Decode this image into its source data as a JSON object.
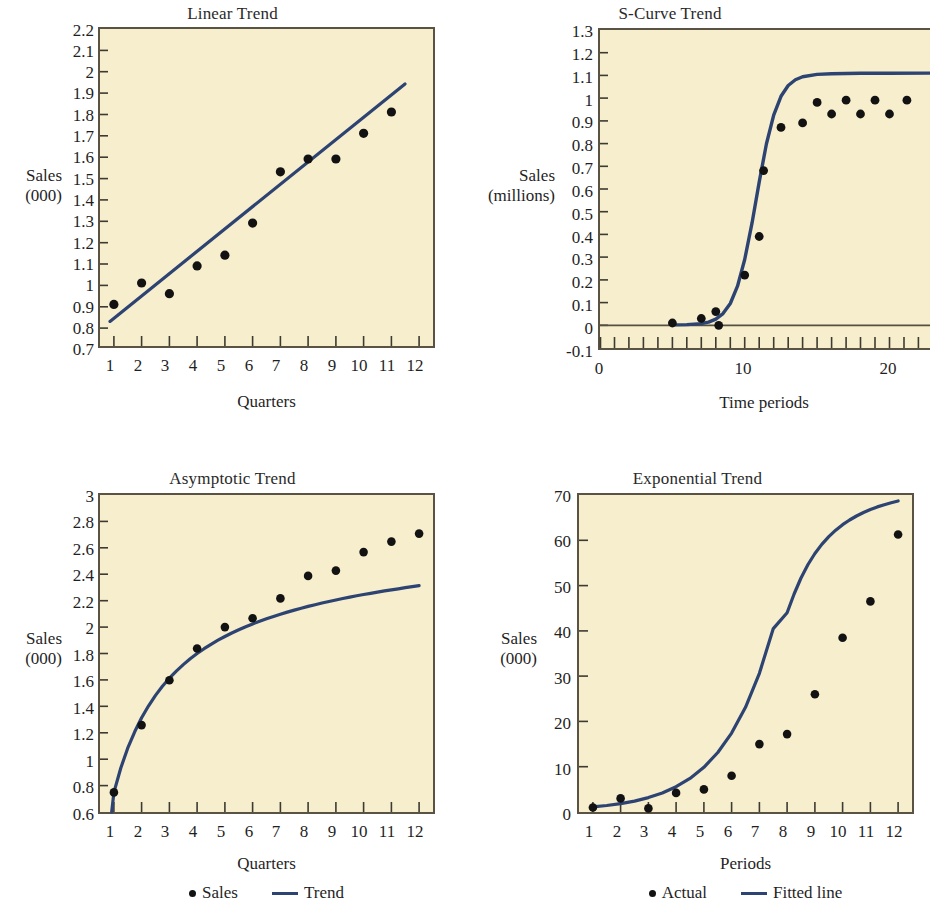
{
  "figure": {
    "background": "#ffffff",
    "panel_background": "#f7eecd",
    "panel_border_color": "#5a5344",
    "line_color": "#2d4372",
    "marker_color": "#121212"
  },
  "charts": [
    {
      "id": "linear-trend",
      "type": "scatter",
      "title": "Linear Trend",
      "xlabel": "Quarters",
      "ylabel": "Sales\n(000)",
      "ylabel_lines": [
        "Sales",
        "(000)"
      ],
      "xlim": [
        0.5,
        12.5
      ],
      "ylim": [
        0.7,
        2.2
      ],
      "xticks": [
        1,
        2,
        3,
        4,
        5,
        6,
        7,
        8,
        9,
        10,
        11,
        12
      ],
      "xtick_labels": [
        "1",
        "2",
        "3",
        "4",
        "5",
        "6",
        "7",
        "8",
        "9",
        "10",
        "11",
        "12"
      ],
      "yticks": [
        0.7,
        0.8,
        0.9,
        1.0,
        1.1,
        1.2,
        1.3,
        1.4,
        1.5,
        1.6,
        1.7,
        1.8,
        1.9,
        2.0,
        2.1,
        2.2
      ],
      "ytick_labels": [
        "0.7",
        "0.8",
        "0.9",
        "1",
        "1.1",
        "1.2",
        "1.3",
        "1.4",
        "1.5",
        "1.6",
        "1.7",
        "1.8",
        "1.9",
        "2",
        "2.1",
        "2.2"
      ],
      "grid": false,
      "legend": null,
      "series": [
        {
          "name": "Sales",
          "kind": "points",
          "x": [
            1,
            2,
            3,
            4,
            5,
            6,
            7,
            8,
            9,
            10,
            11
          ],
          "values": [
            0.91,
            1.01,
            0.96,
            1.09,
            1.14,
            1.29,
            1.53,
            1.59,
            1.59,
            1.71,
            1.81
          ]
        },
        {
          "name": "Trend",
          "kind": "line",
          "x": [
            0.85,
            11.6
          ],
          "values": [
            0.83,
            1.95
          ]
        }
      ]
    },
    {
      "id": "s-curve-trend",
      "type": "scatter",
      "title": "S-Curve Trend",
      "xlabel": "Time periods",
      "ylabel": "Sales\n(millions)",
      "ylabel_lines": [
        "Sales",
        "(millions)"
      ],
      "xlim": [
        0,
        22.8
      ],
      "ylim": [
        -0.1,
        1.3
      ],
      "xticks": [
        0,
        1,
        2,
        3,
        4,
        5,
        6,
        7,
        8,
        9,
        10,
        11,
        12,
        13,
        14,
        15,
        16,
        17,
        18,
        19,
        20,
        21,
        22
      ],
      "xtick_labels_shown": {
        "0": "0",
        "10": "10",
        "20": "20"
      },
      "yticks": [
        -0.1,
        0.0,
        0.1,
        0.2,
        0.3,
        0.4,
        0.5,
        0.6,
        0.7,
        0.8,
        0.9,
        1.0,
        1.1,
        1.2,
        1.3
      ],
      "ytick_labels": [
        "-0.1",
        "0",
        "0.1",
        "0.2",
        "0.3",
        "0.4",
        "0.5",
        "0.6",
        "0.7",
        "0.8",
        "0.9",
        "1",
        "1.1",
        "1.2",
        "1.3"
      ],
      "zero_line": 0.0,
      "grid": false,
      "legend": null,
      "series": [
        {
          "name": "Sales",
          "kind": "points",
          "x": [
            5,
            7,
            8,
            8.2,
            10,
            11,
            11.3,
            12.5,
            14,
            15,
            16,
            17,
            18,
            19,
            20,
            21.2
          ],
          "values": [
            0.01,
            0.03,
            0.06,
            0.0,
            0.22,
            0.39,
            0.68,
            0.87,
            0.89,
            0.98,
            0.93,
            0.99,
            0.93,
            0.99,
            0.93,
            0.99
          ]
        },
        {
          "name": "Trend",
          "kind": "curve-logistic",
          "L": 0.96,
          "k": 1.05,
          "x0": 11.2,
          "x_range": [
            5.0,
            22.8
          ]
        }
      ]
    },
    {
      "id": "asymptotic-trend",
      "type": "scatter",
      "title": "Asymptotic Trend",
      "xlabel": "Quarters",
      "ylabel": "Sales\n(000)",
      "ylabel_lines": [
        "Sales",
        "(000)"
      ],
      "xlim": [
        0.5,
        12.5
      ],
      "ylim": [
        0.6,
        3.0
      ],
      "xticks": [
        1,
        2,
        3,
        4,
        5,
        6,
        7,
        8,
        9,
        10,
        11,
        12
      ],
      "xtick_labels": [
        "1",
        "2",
        "3",
        "4",
        "5",
        "6",
        "7",
        "8",
        "9",
        "10",
        "11",
        "12"
      ],
      "yticks": [
        0.6,
        0.8,
        1.0,
        1.2,
        1.4,
        1.6,
        1.8,
        2.0,
        2.2,
        2.4,
        2.6,
        2.8,
        3.0
      ],
      "ytick_labels": [
        "0.6",
        "0.8",
        "1",
        "1.2",
        "1.4",
        "1.6",
        "1.8",
        "2",
        "2.2",
        "2.4",
        "2.6",
        "2.8",
        "3"
      ],
      "grid": false,
      "legend": {
        "position": "bottom",
        "items": [
          {
            "label": "Sales",
            "marker": "dot"
          },
          {
            "label": "Trend",
            "marker": "line"
          }
        ]
      },
      "series": [
        {
          "name": "Sales",
          "kind": "points",
          "x": [
            1,
            2,
            3,
            4,
            5,
            6,
            7,
            8,
            9,
            10,
            11,
            12
          ],
          "values": [
            0.75,
            1.26,
            1.6,
            1.84,
            2.0,
            2.07,
            2.22,
            2.39,
            2.43,
            2.57,
            2.65,
            2.71
          ]
        },
        {
          "name": "Trend",
          "kind": "curve-asymptotic",
          "a": 3.45,
          "b": 2.78,
          "c": 0.72,
          "x_range": [
            0.92,
            12.0
          ]
        }
      ]
    },
    {
      "id": "exponential-trend",
      "type": "scatter",
      "title": "Exponential Trend",
      "xlabel": "Periods",
      "ylabel": "Sales\n(000)",
      "ylabel_lines": [
        "Sales",
        "(000)"
      ],
      "xlim": [
        0.5,
        12.5
      ],
      "ylim": [
        0,
        70
      ],
      "xticks": [
        1,
        2,
        3,
        4,
        5,
        6,
        7,
        8,
        9,
        10,
        11,
        12
      ],
      "xtick_labels": [
        "1",
        "2",
        "3",
        "4",
        "5",
        "6",
        "7",
        "8",
        "9",
        "10",
        "11",
        "12"
      ],
      "yticks": [
        0,
        10,
        20,
        30,
        40,
        50,
        60,
        70
      ],
      "ytick_labels": [
        "0",
        "10",
        "20",
        "30",
        "40",
        "50",
        "60",
        "70"
      ],
      "grid": false,
      "legend": {
        "position": "bottom",
        "items": [
          {
            "label": "Actual",
            "marker": "dot"
          },
          {
            "label": "Fitted line",
            "marker": "line"
          }
        ]
      },
      "series": [
        {
          "name": "Actual",
          "kind": "points",
          "x": [
            1,
            2,
            3,
            4,
            5,
            6,
            7,
            8,
            9,
            10,
            11,
            12
          ],
          "values": [
            1.0,
            3.0,
            0.8,
            4.2,
            5.0,
            8.0,
            15.0,
            17.2,
            26.0,
            38.5,
            46.5,
            61.3
          ]
        },
        {
          "name": "Fitted line",
          "kind": "curve-exponential",
          "a": 0.78,
          "b": 0.3745,
          "x_range": [
            1.0,
            12.0
          ]
        }
      ]
    }
  ]
}
